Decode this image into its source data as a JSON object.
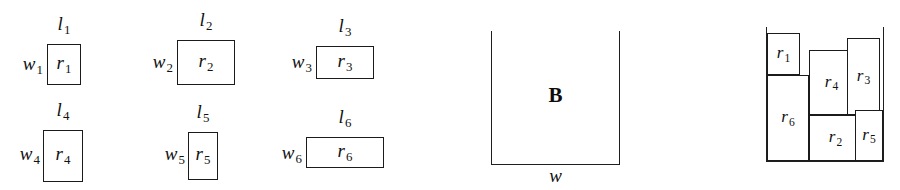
{
  "figure": {
    "caption": "",
    "ink_color": "#1b1b1b",
    "background_color": "#ffffff"
  },
  "items": [
    {
      "id": "r1",
      "name": "r",
      "index": "1",
      "length_label": "l",
      "width_label": "w",
      "x": 47,
      "y": 44,
      "w": 34,
      "h": 41
    },
    {
      "id": "r2",
      "name": "r",
      "index": "2",
      "length_label": "l",
      "width_label": "w",
      "x": 177,
      "y": 40,
      "w": 58,
      "h": 45
    },
    {
      "id": "r3",
      "name": "r",
      "index": "3",
      "length_label": "l",
      "width_label": "w",
      "x": 316,
      "y": 46,
      "w": 58,
      "h": 33
    },
    {
      "id": "r4",
      "name": "r",
      "index": "4",
      "length_label": "l",
      "width_label": "w",
      "x": 43,
      "y": 130,
      "w": 40,
      "h": 52
    },
    {
      "id": "r5",
      "name": "r",
      "index": "5",
      "length_label": "l",
      "width_label": "w",
      "x": 188,
      "y": 132,
      "w": 30,
      "h": 48
    },
    {
      "id": "r6",
      "name": "r",
      "index": "6",
      "length_label": "l",
      "width_label": "w",
      "x": 306,
      "y": 137,
      "w": 78,
      "h": 31
    }
  ],
  "bin": {
    "letter": "B",
    "width_label": "w",
    "x": 491,
    "y": 31,
    "w": 129,
    "h": 134
  },
  "packing": {
    "wall_left_x": 766,
    "wall_right_x": 883,
    "wall_top_y": 27,
    "floor_y": 161,
    "floor_x1": 766,
    "floor_x2": 884,
    "rects": [
      {
        "id": "r1",
        "name": "r",
        "index": "1",
        "x": 767,
        "y": 33,
        "w": 33,
        "h": 42
      },
      {
        "id": "r6",
        "name": "r",
        "index": "6",
        "x": 767,
        "y": 75,
        "w": 42,
        "h": 86
      },
      {
        "id": "r4",
        "name": "r",
        "index": "4",
        "x": 809,
        "y": 50,
        "w": 45,
        "h": 65
      },
      {
        "id": "r3",
        "name": "r",
        "index": "3",
        "x": 847,
        "y": 38,
        "w": 33,
        "h": 77
      },
      {
        "id": "r2",
        "name": "r",
        "index": "2",
        "x": 809,
        "y": 115,
        "w": 53,
        "h": 46
      },
      {
        "id": "r5",
        "name": "r",
        "index": "5",
        "x": 855,
        "y": 110,
        "w": 28,
        "h": 51
      }
    ]
  }
}
